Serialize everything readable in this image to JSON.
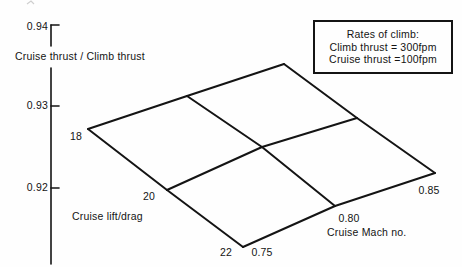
{
  "figure_bg": "#fefefe",
  "line_color": "#141414",
  "chart_data": {
    "type": "carpet",
    "title": "",
    "yaxis": {
      "label": "Cruise thrust / Climb thrust",
      "tick_labels": [
        "0.94",
        "0.93",
        "0.92"
      ],
      "ticks": [
        0.94,
        0.93,
        0.92
      ],
      "range_shown": [
        0.92,
        0.94
      ],
      "grid": false
    },
    "carpet_axes": {
      "lift_drag": {
        "label": "Cruise lift/drag",
        "tick_labels": [
          "18",
          "20",
          "22"
        ],
        "values": [
          18,
          20,
          22
        ]
      },
      "mach": {
        "label": "Cruise Mach no.",
        "tick_labels": [
          "0.75",
          "0.80",
          "0.85"
        ],
        "values": [
          0.75,
          0.8,
          0.85
        ]
      }
    },
    "series": [
      {
        "name": "lift/drag = 18",
        "mach": [
          0.75,
          0.8,
          0.85
        ],
        "thrust_ratio": [
          0.927,
          0.931,
          0.935
        ]
      },
      {
        "name": "lift/drag = 20",
        "mach": [
          0.75,
          0.8,
          0.85
        ],
        "thrust_ratio": [
          0.92,
          0.925,
          0.929
        ]
      },
      {
        "name": "lift/drag = 22",
        "mach": [
          0.75,
          0.8,
          0.85
        ],
        "thrust_ratio": [
          0.913,
          0.918,
          0.922
        ]
      }
    ],
    "legend": {
      "position": "top-right",
      "line1": "Rates of climb:",
      "line2": "Climb thrust = 300fpm",
      "line3": "Cruise thrust =100fpm"
    },
    "render": {
      "stroke_width_mesh": 2,
      "stroke_width_axis": 1.6,
      "axis_x": 51,
      "axis_segments": [
        [
          51,
          25,
          51,
          46
        ],
        [
          51,
          68,
          51,
          264
        ]
      ],
      "tick_ys": [
        25,
        106,
        188
      ],
      "tick_len": 8,
      "mesh_nodes": [
        [
          [
            88,
            129
          ],
          [
            187,
            96
          ],
          [
            284,
            64
          ]
        ],
        [
          [
            167,
            190
          ],
          [
            262,
            147
          ],
          [
            357,
            118
          ]
        ],
        [
          [
            243,
            247
          ],
          [
            335,
            206
          ],
          [
            435,
            173
          ]
        ]
      ]
    }
  }
}
